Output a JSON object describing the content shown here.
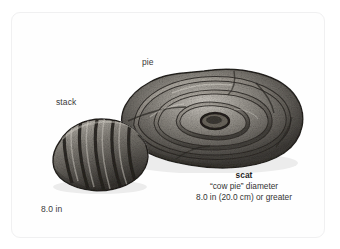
{
  "figure": {
    "background_color": "#ffffff",
    "card_color": "#fefefe",
    "card_border_color": "#f0f0f1",
    "ink_color": "#2b2b2b",
    "text_color": "#3a3a3a",
    "labels": {
      "pie": "pie",
      "stack": "stack",
      "scale": "8.0 in"
    },
    "caption": {
      "title": "scat",
      "line_1": "“cow pie” diameter",
      "line_2": "8.0 in (20.0 cm) or greater"
    },
    "illustrations": [
      {
        "name": "pie-scat-illustration",
        "form": "pie",
        "description": "large coiled flattened mass with concentric swirled lobes, stippled ink shading"
      },
      {
        "name": "stack-scat-illustration",
        "form": "stack",
        "description": "smaller segmented loaf with diagonal ridged folds, stippled ink shading"
      }
    ]
  }
}
